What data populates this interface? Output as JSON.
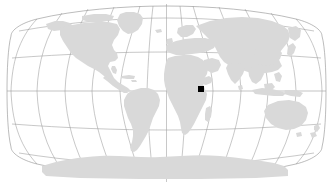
{
  "map": {
    "title": "World map with location marker",
    "projection": "Winkel Tripel",
    "background_color": "#ffffff",
    "land_color": "#d9d9d9",
    "graticule_color": "#9a9a9a",
    "outline_color": "#8e8e8e",
    "marker_color": "#000000",
    "graticule": {
      "meridian_interval_degrees": 30,
      "parallel_interval_degrees": 30,
      "meridian_labels": [
        "180W",
        "150W",
        "120W",
        "90W",
        "60W",
        "30W",
        "0",
        "30E",
        "60E",
        "90E",
        "120E",
        "150E",
        "180E"
      ],
      "parallel_labels": [
        "60N",
        "30N",
        "0",
        "30S",
        "60S"
      ],
      "equator_label": "0",
      "prime_meridian_label": "0"
    },
    "marker": {
      "name": "location-marker",
      "shape": "square",
      "longitude_degrees": 37.0,
      "latitude_degrees": -2.0,
      "region": "East Africa",
      "x_px": 201,
      "y_px": 89,
      "size_px": 6
    },
    "landmasses": [
      {
        "name": "north-america"
      },
      {
        "name": "south-america"
      },
      {
        "name": "greenland"
      },
      {
        "name": "africa"
      },
      {
        "name": "eurasia"
      },
      {
        "name": "australia"
      },
      {
        "name": "antarctica"
      },
      {
        "name": "madagascar"
      },
      {
        "name": "new-zealand"
      },
      {
        "name": "indonesia"
      },
      {
        "name": "japan"
      },
      {
        "name": "british-isles"
      },
      {
        "name": "iceland"
      },
      {
        "name": "caribbean-islands"
      },
      {
        "name": "philippines"
      },
      {
        "name": "sri-lanka"
      },
      {
        "name": "hispaniola"
      }
    ]
  }
}
